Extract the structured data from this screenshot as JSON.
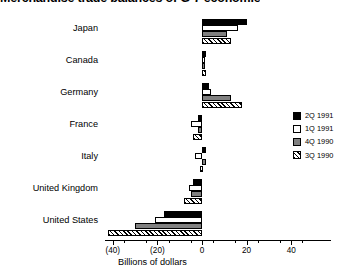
{
  "chart_data": {
    "type": "bar",
    "orientation": "horizontal",
    "title": "Merchandise trade balances of G-7 economies",
    "title_visible_fragment": "ndise trade balances of G-7 economies",
    "xlabel": "Billions of dollars",
    "ylabel": "",
    "xlim": [
      -48,
      50
    ],
    "grid": false,
    "legend_position": "right",
    "negative_format": "parentheses",
    "categories": [
      "Japan",
      "Canada",
      "Germany",
      "France",
      "Italy",
      "United Kingdom",
      "United States"
    ],
    "xticks": [
      -40,
      -20,
      0,
      20,
      40
    ],
    "xtick_labels": [
      "(40)",
      "(20)",
      "0",
      "20",
      "40"
    ],
    "series": [
      {
        "name": "2Q 1991",
        "fill": "solid-black",
        "color": "#000000",
        "values": [
          20,
          2,
          3,
          -2,
          2,
          -4,
          -17
        ]
      },
      {
        "name": "1Q 1991",
        "fill": "white",
        "color": "#ffffff",
        "values": [
          16,
          1,
          4,
          -5,
          -3,
          -6,
          -21
        ]
      },
      {
        "name": "4Q 1990",
        "fill": "gray",
        "color": "#808080",
        "values": [
          11,
          1,
          13,
          -2,
          2,
          -5,
          -30
        ]
      },
      {
        "name": "3Q 1990",
        "fill": "diagonal-hatch",
        "color": "#ffffff",
        "values": [
          13,
          2,
          18,
          -4,
          -1,
          -8,
          -42
        ]
      }
    ]
  }
}
